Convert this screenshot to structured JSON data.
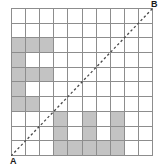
{
  "figure": {
    "colors": {
      "grid_line": "#8d8d8d",
      "cell_fill": "#c3c3c3",
      "cell_empty": "#ffffff",
      "diagonal": "#4a4a4a",
      "label_text": "#1a1a1a",
      "background": "#ffffff"
    }
  },
  "grid": {
    "columns": 10,
    "rows": 10,
    "cells": [
      [
        0,
        0,
        0,
        0,
        0,
        0,
        0,
        0,
        0,
        0
      ],
      [
        0,
        0,
        0,
        0,
        0,
        0,
        0,
        0,
        0,
        0
      ],
      [
        1,
        1,
        1,
        0,
        0,
        0,
        0,
        0,
        0,
        0
      ],
      [
        1,
        0,
        0,
        0,
        0,
        0,
        0,
        0,
        0,
        0
      ],
      [
        1,
        1,
        1,
        0,
        0,
        0,
        0,
        0,
        0,
        0
      ],
      [
        1,
        0,
        0,
        0,
        0,
        0,
        0,
        0,
        0,
        0
      ],
      [
        1,
        1,
        0,
        0,
        0,
        0,
        0,
        0,
        0,
        0
      ],
      [
        0,
        0,
        0,
        1,
        0,
        1,
        0,
        1,
        0,
        0
      ],
      [
        0,
        0,
        0,
        1,
        0,
        1,
        0,
        1,
        0,
        0
      ],
      [
        0,
        0,
        0,
        1,
        1,
        1,
        1,
        1,
        0,
        0
      ]
    ]
  },
  "diagonal": {
    "style": "dashed",
    "from": "A",
    "to": "B",
    "x1_pct": 0,
    "y1_pct": 100,
    "x2_pct": 100,
    "y2_pct": 0
  },
  "labels": {
    "start": "A",
    "end": "B"
  }
}
